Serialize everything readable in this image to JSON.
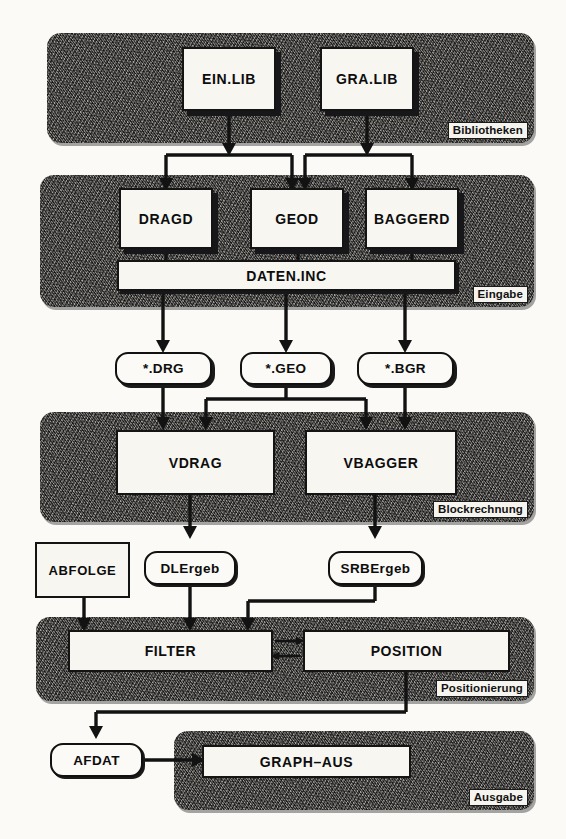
{
  "diagram": {
    "colors": {
      "panel_fill": "#6e6b66",
      "box_fill": "#f7f6f1",
      "ink": "#121212",
      "tag_fill": "#f6f4ef"
    },
    "panels": [
      {
        "id": "bibliotheken",
        "tag": "Bibliotheken"
      },
      {
        "id": "eingabe",
        "tag": "Eingabe"
      },
      {
        "id": "blockrechnung",
        "tag": "Blockrechnung"
      },
      {
        "id": "positionierung",
        "tag": "Positionierung"
      },
      {
        "id": "ausgabe",
        "tag": "Ausgabe"
      }
    ],
    "boxes": {
      "ein_lib": "EIN.LIB",
      "gra_lib": "GRA.LIB",
      "dragd": "DRAGD",
      "geod": "GEOD",
      "baggerd": "BAGGERD",
      "daten_inc": "DATEN.INC",
      "vdrag": "VDRAG",
      "vbagger": "VBAGGER",
      "abfolge": "ABFOLGE",
      "filter": "FILTER",
      "position": "POSITION",
      "graph_aus": "GRAPH–AUS"
    },
    "capsules": {
      "drg": "*.DRG",
      "geo": "*.GEO",
      "bgr": "*.BGR",
      "dlergeb": "DLErgeb",
      "srbergeb": "SRBErgeb",
      "afdat": "AFDAT"
    }
  }
}
